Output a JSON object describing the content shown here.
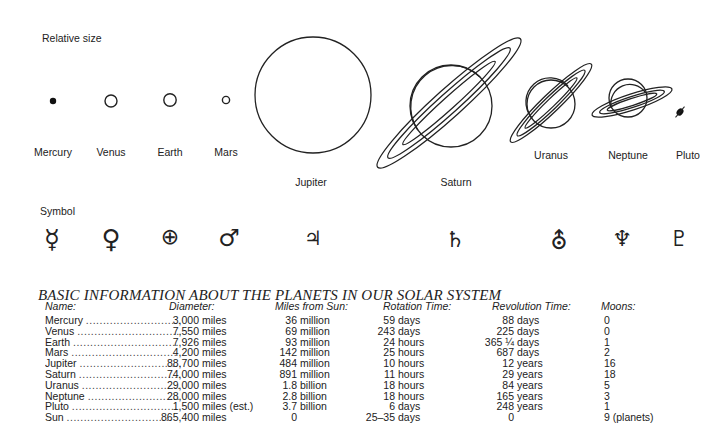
{
  "diagram": {
    "relative_size_label": "Relative size",
    "symbol_label": "Symbol",
    "planets": [
      {
        "name": "Mercury",
        "symbol": "☿",
        "x": 53
      },
      {
        "name": "Venus",
        "symbol": "♀",
        "x": 111
      },
      {
        "name": "Earth",
        "symbol": "⊕",
        "x": 170
      },
      {
        "name": "Mars",
        "symbol": "♂",
        "x": 226
      },
      {
        "name": "Jupiter",
        "symbol": "♃",
        "x": 313
      },
      {
        "name": "Saturn",
        "symbol": "♄",
        "x": 456
      },
      {
        "name": "Uranus",
        "symbol": "⛢",
        "x": 551
      },
      {
        "name": "Neptune",
        "symbol": "♆",
        "x": 628
      },
      {
        "name": "Pluto",
        "symbol": "♇",
        "x": 687
      }
    ]
  },
  "table": {
    "title": "BASIC INFORMATION ABOUT THE PLANETS IN OUR SOLAR SYSTEM",
    "headers": {
      "name": "Name:",
      "diameter": "Diameter:",
      "miles_from_sun": "Miles from Sun:",
      "rotation": "Rotation Time:",
      "revolution": "Revolution Time:",
      "moons": "Moons:"
    },
    "rows": [
      {
        "name": "Mercury",
        "diameter_num": "3,000",
        "diameter_unit": "miles",
        "distance_num": "36",
        "distance_unit": "million",
        "rotation_num": "59",
        "rotation_unit": "days",
        "revolution_num": "88",
        "revolution_unit": "days",
        "moons": "0"
      },
      {
        "name": "Venus",
        "diameter_num": "7,550",
        "diameter_unit": "miles",
        "distance_num": "69",
        "distance_unit": "million",
        "rotation_num": "243",
        "rotation_unit": "days",
        "revolution_num": "225",
        "revolution_unit": "days",
        "moons": "0"
      },
      {
        "name": "Earth",
        "diameter_num": "7,926",
        "diameter_unit": "miles",
        "distance_num": "93",
        "distance_unit": "million",
        "rotation_num": "24",
        "rotation_unit": "hours",
        "revolution_num": "365 ¼",
        "revolution_unit": "days",
        "moons": "1"
      },
      {
        "name": "Mars",
        "diameter_num": "4,200",
        "diameter_unit": "miles",
        "distance_num": "142",
        "distance_unit": "million",
        "rotation_num": "25",
        "rotation_unit": "hours",
        "revolution_num": "687",
        "revolution_unit": "days",
        "moons": "2"
      },
      {
        "name": "Jupiter",
        "diameter_num": "88,700",
        "diameter_unit": "miles",
        "distance_num": "484",
        "distance_unit": "million",
        "rotation_num": "10",
        "rotation_unit": "hours",
        "revolution_num": "12",
        "revolution_unit": "years",
        "moons": "16"
      },
      {
        "name": "Saturn",
        "diameter_num": "74,000",
        "diameter_unit": "miles",
        "distance_num": "891",
        "distance_unit": "million",
        "rotation_num": "11",
        "rotation_unit": "hours",
        "revolution_num": "29",
        "revolution_unit": "years",
        "moons": "18"
      },
      {
        "name": "Uranus",
        "diameter_num": "29,000",
        "diameter_unit": "miles",
        "distance_num": "1.8",
        "distance_unit": "billion",
        "rotation_num": "18",
        "rotation_unit": "hours",
        "revolution_num": "84",
        "revolution_unit": "years",
        "moons": "5"
      },
      {
        "name": "Neptune",
        "diameter_num": "28,000",
        "diameter_unit": "miles",
        "distance_num": "2.8",
        "distance_unit": "billion",
        "rotation_num": "18",
        "rotation_unit": "hours",
        "revolution_num": "165",
        "revolution_unit": "years",
        "moons": "3"
      },
      {
        "name": "Pluto",
        "diameter_num": "1,500",
        "diameter_unit": "miles (est.)",
        "distance_num": "3.7",
        "distance_unit": "billion",
        "rotation_num": "6",
        "rotation_unit": "days",
        "revolution_num": "248",
        "revolution_unit": "years",
        "moons": "1"
      },
      {
        "name": "Sun",
        "diameter_num": "865,400",
        "diameter_unit": "miles",
        "distance_num": "0",
        "distance_unit": "",
        "rotation_num": "25–35",
        "rotation_unit": "days",
        "revolution_num": "0",
        "revolution_unit": "",
        "moons": "9 (planets)"
      }
    ],
    "dots": "..............................."
  }
}
